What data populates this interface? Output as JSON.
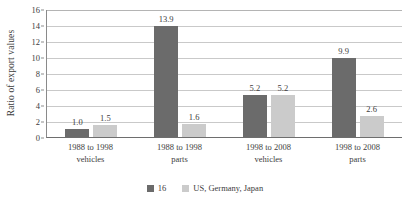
{
  "chart_data": {
    "type": "bar",
    "title": "",
    "subtitle": "",
    "xlabel": "",
    "ylabel": "Ratio of export values",
    "ylim": [
      0,
      16
    ],
    "ytick_step": 2,
    "yticks": [
      "0",
      "2",
      "4",
      "6",
      "8",
      "10",
      "12",
      "14",
      "16"
    ],
    "grid": "horizontal",
    "legend_position": "bottom-center",
    "categories": [
      {
        "line1": "1988 to 1998",
        "line2": "vehicles"
      },
      {
        "line1": "1988 to 1998",
        "line2": "parts"
      },
      {
        "line1": "1998 to 2008",
        "line2": "vehicles"
      },
      {
        "line1": "1998 to 2008",
        "line2": "parts"
      }
    ],
    "series": [
      {
        "name": "16",
        "color": "#6b6b6b",
        "values": [
          1.0,
          13.9,
          5.2,
          9.9
        ],
        "labels": [
          "1.0",
          "13.9",
          "5.2",
          "9.9"
        ]
      },
      {
        "name": "US, Germany, Japan",
        "color": "#cbcbcb",
        "values": [
          1.5,
          1.6,
          5.2,
          2.6
        ],
        "labels": [
          "1.5",
          "1.6",
          "5.2",
          "2.6"
        ]
      }
    ]
  },
  "legend": {
    "items": [
      {
        "label": "16",
        "color": "#6b6b6b"
      },
      {
        "label": "US, Germany, Japan",
        "color": "#cbcbcb"
      }
    ]
  },
  "axis": {
    "y_title": "Ratio of export values"
  }
}
